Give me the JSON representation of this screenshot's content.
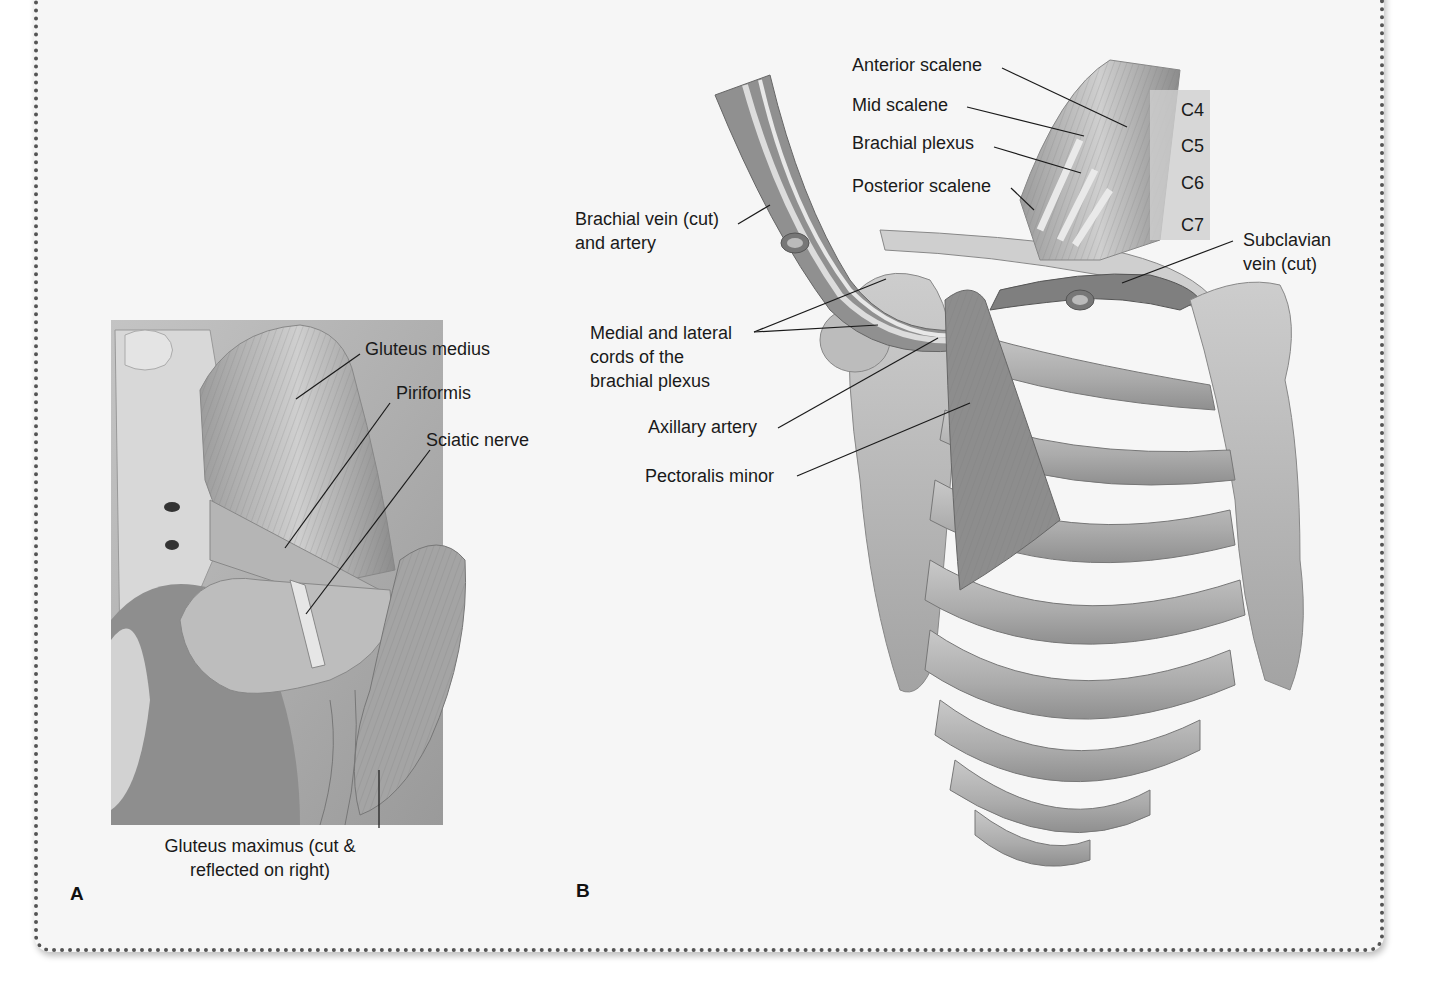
{
  "figure": {
    "panels": [
      {
        "id": "A",
        "letter": "A",
        "labels": {
          "gluteus_medius": "Gluteus medius",
          "piriformis": "Piriformis",
          "sciatic_nerve": "Sciatic nerve",
          "gluteus_maximus_line1": "Gluteus maximus (cut &",
          "gluteus_maximus_line2": "reflected on right)"
        }
      },
      {
        "id": "B",
        "letter": "B",
        "labels": {
          "anterior_scalene": "Anterior scalene",
          "mid_scalene": "Mid scalene",
          "brachial_plexus": "Brachial plexus",
          "posterior_scalene": "Posterior scalene",
          "brachial_vein_line1": "Brachial vein (cut)",
          "brachial_vein_line2": "and artery",
          "cords_line1": "Medial and lateral",
          "cords_line2": "cords of the",
          "cords_line3": "brachial plexus",
          "axillary_artery": "Axillary artery",
          "pectoralis_minor": "Pectoralis minor",
          "subclavian_line1": "Subclavian",
          "subclavian_line2": "vein (cut)",
          "vertebrae": [
            "C4",
            "C5",
            "C6",
            "C7"
          ]
        }
      }
    ],
    "colors": {
      "background": "#f6f6f6",
      "border_dots": "#555555",
      "muscle_gray": "#8a8a8a",
      "bone_gray": "#b8b8b8",
      "text": "#1a1a1a"
    }
  }
}
